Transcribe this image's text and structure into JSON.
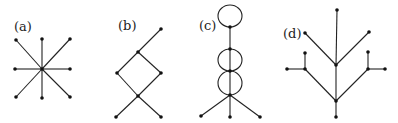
{
  "figure": {
    "panels": [
      {
        "id": "a",
        "label": "(a)",
        "label_pos": [
          14,
          31
        ],
        "description": "star graph with 8 leaves",
        "nodes": [
          [
            42,
            69
          ],
          [
            16,
            40
          ],
          [
            42,
            39
          ],
          [
            70,
            39
          ],
          [
            15,
            69
          ],
          [
            70,
            69
          ],
          [
            16,
            97
          ],
          [
            42,
            98
          ],
          [
            70,
            97
          ]
        ],
        "edges": [
          [
            0,
            1
          ],
          [
            0,
            2
          ],
          [
            0,
            3
          ],
          [
            0,
            4
          ],
          [
            0,
            5
          ],
          [
            0,
            6
          ],
          [
            0,
            7
          ],
          [
            0,
            8
          ]
        ],
        "loops": []
      },
      {
        "id": "b",
        "label": "(b)",
        "label_pos": [
          118,
          30
        ],
        "description": "4-cycle with pendant edges",
        "nodes": [
          [
            161,
            29
          ],
          [
            138,
            52
          ],
          [
            117,
            73
          ],
          [
            161,
            73
          ],
          [
            138,
            96
          ],
          [
            116,
            117
          ],
          [
            161,
            117
          ]
        ],
        "edges": [
          [
            0,
            1
          ],
          [
            1,
            2
          ],
          [
            1,
            3
          ],
          [
            2,
            4
          ],
          [
            3,
            4
          ],
          [
            4,
            5
          ],
          [
            4,
            6
          ]
        ],
        "loops": []
      },
      {
        "id": "c",
        "label": "(c)",
        "label_pos": [
          199,
          30
        ],
        "description": "path with multiple loops and three pendant leaves",
        "nodes": [
          [
            230,
            27
          ],
          [
            230,
            49
          ],
          [
            230,
            71
          ],
          [
            230,
            95
          ],
          [
            201,
            116
          ],
          [
            230,
            117
          ],
          [
            260,
            117
          ]
        ],
        "edges": [
          [
            0,
            1
          ],
          [
            1,
            2
          ],
          [
            2,
            3
          ],
          [
            3,
            4
          ],
          [
            3,
            5
          ],
          [
            3,
            6
          ]
        ],
        "loops": [
          {
            "cx": 230,
            "cy": 16,
            "rx": 12,
            "ry": 11
          },
          {
            "cx": 230,
            "cy": 60,
            "rx": 12,
            "ry": 11
          },
          {
            "cx": 230,
            "cy": 83,
            "rx": 12,
            "ry": 12
          }
        ]
      },
      {
        "id": "d",
        "label": "(d)",
        "label_pos": [
          283,
          38
        ],
        "description": "tree with branching structure",
        "nodes": [
          [
            337,
            10
          ],
          [
            305,
            33
          ],
          [
            369,
            32
          ],
          [
            336,
            65
          ],
          [
            305,
            53
          ],
          [
            287,
            69
          ],
          [
            305,
            69
          ],
          [
            368,
            52
          ],
          [
            368,
            69
          ],
          [
            385,
            69
          ],
          [
            336,
            101
          ],
          [
            336,
            117
          ]
        ],
        "edges": [
          [
            0,
            3
          ],
          [
            1,
            3
          ],
          [
            2,
            3
          ],
          [
            3,
            10
          ],
          [
            4,
            6
          ],
          [
            5,
            6
          ],
          [
            6,
            10
          ],
          [
            7,
            8
          ],
          [
            8,
            9
          ],
          [
            8,
            10
          ],
          [
            10,
            11
          ]
        ],
        "loops": []
      }
    ]
  }
}
